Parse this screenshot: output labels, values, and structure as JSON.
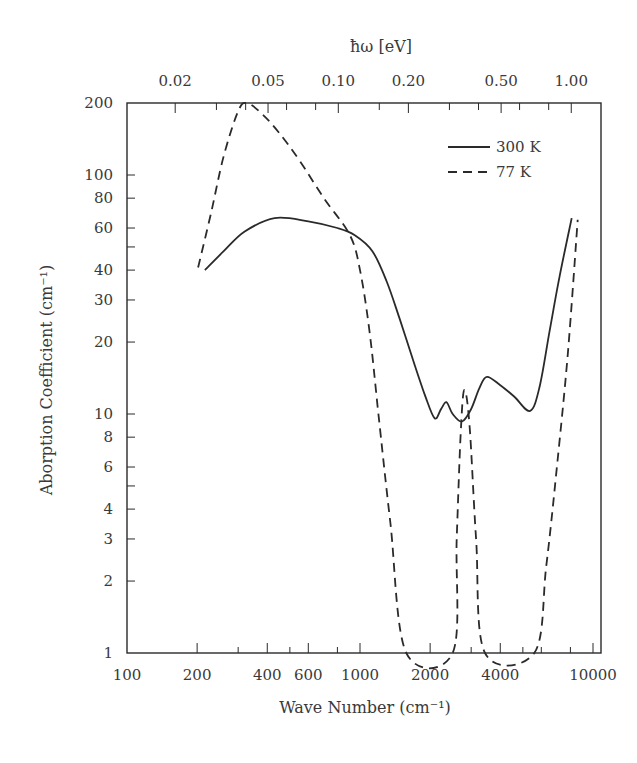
{
  "chart_data": {
    "type": "line",
    "title": "",
    "xlabel": "Wave Number (cm⁻¹)",
    "ylabel": "Aborption Coefficient (cm⁻¹)",
    "top_xlabel": "ħω [eV]",
    "xscale": "log",
    "yscale": "log",
    "xlim": [
      100,
      12000
    ],
    "ylim": [
      1,
      200
    ],
    "grid": false,
    "legend_position": "upper right",
    "x_ticks": [
      {
        "value": 100,
        "label": "100"
      },
      {
        "value": 200,
        "label": "200"
      },
      {
        "value": 400,
        "label": "400"
      },
      {
        "value": 600,
        "label": "600"
      },
      {
        "value": 1000,
        "label": "1000"
      },
      {
        "value": 2000,
        "label": "2000"
      },
      {
        "value": 4000,
        "label": "4000"
      },
      {
        "value": 10000,
        "label": "10000"
      }
    ],
    "x_minor_ticks": [
      300,
      500,
      800,
      3000,
      5000,
      6000,
      8000
    ],
    "top_ticks": [
      {
        "wavenumber": 161,
        "label": "0.02"
      },
      {
        "wavenumber": 403,
        "label": "0.05"
      },
      {
        "wavenumber": 807,
        "label": "0.10"
      },
      {
        "wavenumber": 1613,
        "label": "0.20"
      },
      {
        "wavenumber": 4033,
        "label": "0.50"
      },
      {
        "wavenumber": 8066,
        "label": "1.00"
      }
    ],
    "top_minor_ticks": [
      242,
      323,
      484,
      645,
      1210,
      2420,
      3226,
      4840,
      6453
    ],
    "y_ticks": [
      {
        "value": 1,
        "label": "1"
      },
      {
        "value": 2,
        "label": "2"
      },
      {
        "value": 3,
        "label": "3"
      },
      {
        "value": 4,
        "label": "4"
      },
      {
        "value": 6,
        "label": "6"
      },
      {
        "value": 8,
        "label": "8"
      },
      {
        "value": 10,
        "label": "10"
      },
      {
        "value": 20,
        "label": "20"
      },
      {
        "value": 30,
        "label": "30"
      },
      {
        "value": 40,
        "label": "40"
      },
      {
        "value": 60,
        "label": "60"
      },
      {
        "value": 80,
        "label": "80"
      },
      {
        "value": 100,
        "label": "100"
      },
      {
        "value": 200,
        "label": "200"
      }
    ],
    "y_minor_ticks": [
      5,
      50
    ],
    "series": [
      {
        "name": "300 K",
        "style": "solid",
        "x": [
          216,
          260,
          320,
          430,
          600,
          800,
          950,
          1130,
          1300,
          1480,
          1700,
          1900,
          2090,
          2230,
          2350,
          2500,
          2740,
          3000,
          3250,
          3500,
          4000,
          4600,
          5370,
          5900,
          6500,
          7200,
          8100
        ],
        "y": [
          40,
          48,
          58,
          66,
          64,
          60,
          56,
          48,
          36,
          25,
          16.5,
          12,
          9.6,
          10.5,
          11.2,
          10,
          9.3,
          10.5,
          12.8,
          14.3,
          13.2,
          11.8,
          10.3,
          13,
          22,
          38,
          66
        ]
      },
      {
        "name": "77 K",
        "style": "dashed",
        "x": [
          202,
          230,
          260,
          300,
          327,
          380,
          450,
          550,
          700,
          905,
          1000,
          1100,
          1200,
          1350,
          1580,
          2500,
          2600,
          2700,
          2800,
          2950,
          3150,
          3440,
          5600,
          6300,
          7000,
          7800,
          8600
        ],
        "y": [
          41,
          70,
          120,
          185,
          200,
          180,
          150,
          115,
          80,
          56,
          40,
          22,
          10,
          3.5,
          1,
          1,
          3,
          8,
          12.6,
          9,
          3,
          1,
          1,
          2.3,
          6,
          18,
          65
        ]
      }
    ]
  },
  "legend": {
    "items": [
      {
        "label": "300 K",
        "style": "solid"
      },
      {
        "label": "77 K",
        "style": "dashed"
      }
    ]
  },
  "colors": {
    "line": "#2a2a2a",
    "axis": "#2a2a2a",
    "text": "#3a3a3a"
  }
}
